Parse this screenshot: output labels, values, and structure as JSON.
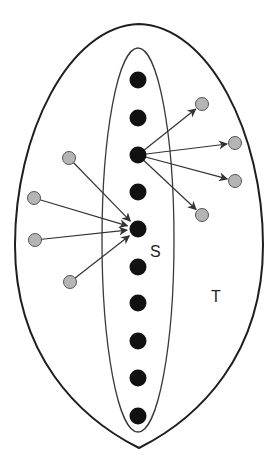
{
  "diagram": {
    "labels": {
      "inner_set": "S",
      "outer_set": "T"
    },
    "colors": {
      "background": "#ffffff",
      "outline": "#1e1e1e",
      "inner_outline": "#3a3a3a",
      "black_node": "#111111",
      "gray_node_fill": "#b5b5b5",
      "gray_node_stroke": "#555555",
      "arrow": "#333333"
    },
    "outer_shape": {
      "top": [
        139,
        24
      ],
      "bottom": [
        139,
        448
      ],
      "left_x": 15,
      "right_x": 263
    },
    "inner_ellipse": {
      "cx": 138,
      "cy": 240,
      "rx": 36,
      "ry": 192
    },
    "black_nodes": [
      {
        "x": 138,
        "y": 80
      },
      {
        "x": 138,
        "y": 118
      },
      {
        "x": 138,
        "y": 155
      },
      {
        "x": 138,
        "y": 192
      },
      {
        "x": 138,
        "y": 229
      },
      {
        "x": 138,
        "y": 267
      },
      {
        "x": 138,
        "y": 303
      },
      {
        "x": 138,
        "y": 341
      },
      {
        "x": 138,
        "y": 378
      },
      {
        "x": 138,
        "y": 416
      }
    ],
    "gray_nodes_out": [
      {
        "x": 202,
        "y": 104
      },
      {
        "x": 235,
        "y": 143
      },
      {
        "x": 235,
        "y": 181
      },
      {
        "x": 202,
        "y": 215
      }
    ],
    "gray_nodes_in": [
      {
        "x": 69,
        "y": 158
      },
      {
        "x": 34,
        "y": 198
      },
      {
        "x": 35,
        "y": 240
      },
      {
        "x": 70,
        "y": 282
      }
    ],
    "out_source_index": 2,
    "in_target_index": 4
  }
}
